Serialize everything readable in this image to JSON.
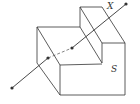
{
  "diagram": {
    "labels": {
      "line": "X",
      "solid": "S"
    },
    "colors": {
      "stroke": "#333333",
      "background": "#ffffff"
    },
    "points": [
      {
        "x": 12,
        "y": 88
      },
      {
        "x": 48,
        "y": 58
      },
      {
        "x": 72,
        "y": 48
      },
      {
        "x": 126,
        "y": 4
      }
    ]
  }
}
